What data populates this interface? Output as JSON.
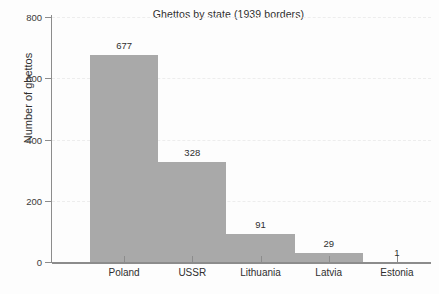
{
  "chart_data": {
    "type": "bar",
    "title": "Ghettos by state (1939 borders)",
    "xlabel": "",
    "ylabel": "Number of ghettos",
    "categories": [
      "Poland",
      "USSR",
      "Lithuania",
      "Latvia",
      "Estonia"
    ],
    "values": [
      677,
      328,
      91,
      29,
      1
    ],
    "value_labels": [
      "677",
      "328",
      "91",
      "29",
      "1"
    ],
    "ylim": [
      0,
      800
    ],
    "yticks": [
      0,
      200,
      400,
      600,
      800
    ],
    "ytick_labels": [
      "0",
      "200",
      "400",
      "600",
      "800"
    ],
    "grid": "horizontal-dashed-light",
    "legend": "none",
    "bar_color": "#a9a9a9",
    "axis_color": "#8c8c8c",
    "text_color": "#2f2f2f",
    "background_color": "#fdfdfd",
    "bar_style": "contiguous-histogram-like",
    "series": [
      {
        "name": "Number of ghettos",
        "values": [
          677,
          328,
          91,
          29,
          1
        ]
      }
    ]
  }
}
